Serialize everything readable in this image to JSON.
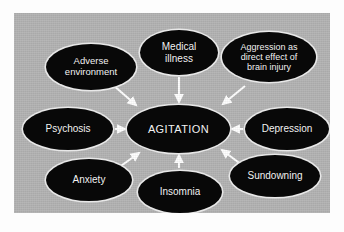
{
  "figure": {
    "type": "concept-map",
    "background_color": "#b3b3b3",
    "node_fill_color": "#080808",
    "node_text_color": "#f2f2f2",
    "arrow_color": "#ffffff"
  },
  "center": {
    "id": "agitation",
    "label": "AGITATION"
  },
  "nodes": [
    {
      "id": "adverse-environment",
      "label": "Adverse\nenvironment",
      "line1": "Adverse",
      "line2": "environment",
      "position": "upper-left"
    },
    {
      "id": "medical-illness",
      "label": "Medical\nillness",
      "line1": "Medical",
      "line2": "illness",
      "position": "top-center"
    },
    {
      "id": "aggression-brain-injury",
      "label": "Aggression as\ndirect effect of\nbrain injury",
      "line1": "Aggression as",
      "line2": "direct effect of",
      "line3": "brain injury",
      "position": "top-right"
    },
    {
      "id": "psychosis",
      "label": "Psychosis",
      "line1": "Psychosis",
      "position": "left-middle"
    },
    {
      "id": "depression",
      "label": "Depression",
      "line1": "Depression",
      "position": "right-middle"
    },
    {
      "id": "anxiety",
      "label": "Anxiety",
      "line1": "Anxiety",
      "position": "lower-left"
    },
    {
      "id": "insomnia",
      "label": "Insomnia",
      "line1": "Insomnia",
      "position": "bottom-center"
    },
    {
      "id": "sundowning",
      "label": "Sundowning",
      "line1": "Sundowning",
      "position": "lower-right"
    }
  ],
  "edges": [
    {
      "from": "adverse-environment",
      "to": "agitation",
      "direction": "down-right"
    },
    {
      "from": "medical-illness",
      "to": "agitation",
      "direction": "down"
    },
    {
      "from": "aggression-brain-injury",
      "to": "agitation",
      "direction": "down-left"
    },
    {
      "from": "psychosis",
      "to": "agitation",
      "direction": "right"
    },
    {
      "from": "depression",
      "to": "agitation",
      "direction": "left"
    },
    {
      "from": "anxiety",
      "to": "agitation",
      "direction": "up-right"
    },
    {
      "from": "insomnia",
      "to": "agitation",
      "direction": "up"
    },
    {
      "from": "sundowning",
      "to": "agitation",
      "direction": "up-left"
    }
  ]
}
